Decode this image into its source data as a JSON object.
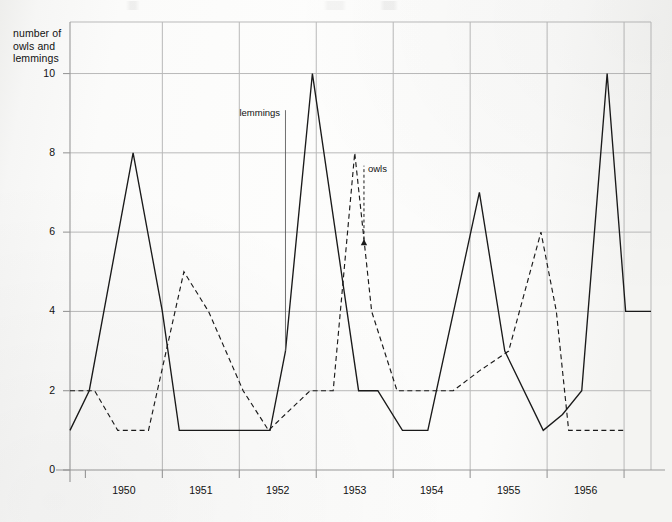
{
  "chart_data": {
    "type": "line",
    "title": "",
    "xlabel": "year",
    "ylabel": "number of owls and lemmings",
    "xlim": [
      1949.3,
      1956.85
    ],
    "ylim": [
      0,
      11.3
    ],
    "grid": true,
    "legend": "inline-annotations",
    "y_ticks": [
      2,
      4,
      6,
      8,
      10
    ],
    "y_tick_labels": [
      "2",
      "4",
      "6",
      "8",
      "10"
    ],
    "y_zero_label": "0",
    "x_ticks": [
      1949.5,
      1950.5,
      1951.5,
      1952.5,
      1953.5,
      1954.5,
      1955.5,
      1956.5
    ],
    "x_tick_labels": [
      "1950",
      "1951",
      "1952",
      "1953",
      "1954",
      "1955",
      "1956",
      "year"
    ],
    "series": [
      {
        "name": "lemmings",
        "style": "solid",
        "color": "#1a1a1a",
        "annotation": "lemmings",
        "x": [
          1949.3,
          1949.55,
          1950.12,
          1950.5,
          1950.72,
          1951.3,
          1951.9,
          1952.1,
          1952.45,
          1953.05,
          1953.3,
          1953.62,
          1953.95,
          1954.62,
          1954.95,
          1955.45,
          1955.7,
          1955.95,
          1956.28,
          1956.52,
          1956.85
        ],
        "y": [
          1.0,
          2.0,
          8.0,
          4.0,
          1.0,
          1.0,
          1.0,
          3.0,
          10.0,
          2.0,
          2.0,
          1.0,
          1.0,
          7.0,
          3.0,
          1.0,
          1.4,
          2.0,
          10.0,
          4.0,
          4.0
        ]
      },
      {
        "name": "owls",
        "style": "dashed",
        "color": "#1a1a1a",
        "annotation": "owls",
        "x": [
          1949.3,
          1949.62,
          1949.92,
          1950.32,
          1950.78,
          1951.1,
          1951.55,
          1951.88,
          1952.42,
          1952.72,
          1953.0,
          1953.22,
          1953.55,
          1954.28,
          1954.62,
          1955.0,
          1955.42,
          1955.62,
          1955.78,
          1956.52
        ],
        "y": [
          2.0,
          2.0,
          1.0,
          1.0,
          5.0,
          4.0,
          2.0,
          1.0,
          2.0,
          2.0,
          8.0,
          4.0,
          2.0,
          2.0,
          2.5,
          3.0,
          6.0,
          4.0,
          1.0,
          1.0
        ]
      }
    ],
    "annotations": [
      {
        "text": "lemmings",
        "series": "lemmings",
        "x": 1952.1,
        "y": 9.0,
        "leader": true
      },
      {
        "text": "owls",
        "series": "owls",
        "x": 1953.12,
        "y": 7.6,
        "leader": true,
        "arrow": true
      }
    ]
  }
}
